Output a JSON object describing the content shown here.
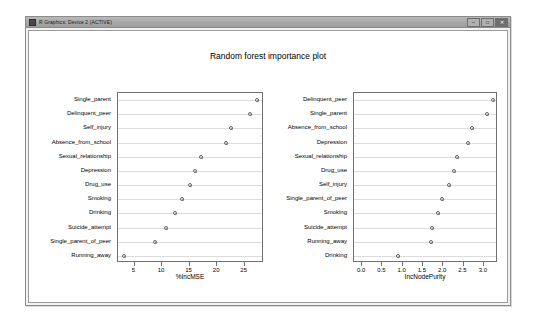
{
  "window": {
    "title": "R Graphics: Device 2 (ACTIVE)",
    "icon": "r-app-icon",
    "buttons": {
      "minimize": "–",
      "maximize": "□",
      "close": "✕"
    }
  },
  "chart_data": [
    {
      "type": "scatter",
      "panel": "left",
      "title": "Random forest importance plot",
      "xlabel": "%IncMSE",
      "ylabel": "",
      "xlim": [
        2.0,
        28.5
      ],
      "xticks": [
        "5",
        "10",
        "15",
        "20",
        "25"
      ],
      "xtickvals": [
        5,
        10,
        15,
        20,
        25
      ],
      "grid": true,
      "legend": "none",
      "categories": [
        "Single_parent",
        "Delinquent_peer",
        "Self_injury",
        "Absence_from_school",
        "Sexual_relationship",
        "Depression",
        "Drug_use",
        "Smoking",
        "Drinking",
        "Suicide_attempt",
        "Single_parent_of_peer",
        "Running_away"
      ],
      "values": [
        27.2,
        25.9,
        22.6,
        21.6,
        17.0,
        15.9,
        15.0,
        13.6,
        12.3,
        10.7,
        8.7,
        3.1
      ]
    },
    {
      "type": "scatter",
      "panel": "right",
      "title": "Random forest importance plot",
      "xlabel": "IncNodePurity",
      "ylabel": "",
      "xlim": [
        -0.2,
        3.35
      ],
      "xticks": [
        "0.0",
        "0.5",
        "1.0",
        "1.5",
        "2.0",
        "2.5",
        "3.0"
      ],
      "xtickvals": [
        0.0,
        0.5,
        1.0,
        1.5,
        2.0,
        2.5,
        3.0
      ],
      "grid": true,
      "legend": "none",
      "categories": [
        "Delinquent_peer",
        "Single_parent",
        "Absence_from_school",
        "Depression",
        "Sexual_relationship",
        "Drug_use",
        "Self_injury",
        "Single_parent_of_peer",
        "Smoking",
        "Suicide_attempt",
        "Running_away",
        "Drinking"
      ],
      "values": [
        3.22,
        3.07,
        2.72,
        2.62,
        2.33,
        2.26,
        2.13,
        1.98,
        1.88,
        1.72,
        1.71,
        0.88
      ]
    }
  ]
}
